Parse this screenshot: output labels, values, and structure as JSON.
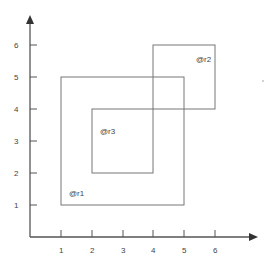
{
  "diagram": {
    "title": "",
    "x_axis": {
      "ticks": [
        {
          "value": 1,
          "label": "1"
        },
        {
          "value": 2,
          "label": "2"
        },
        {
          "value": 3,
          "label": "3"
        },
        {
          "value": 4,
          "label": "4"
        },
        {
          "value": 5,
          "label": "5"
        },
        {
          "value": 6,
          "label": "6"
        }
      ]
    },
    "y_axis": {
      "ticks": [
        {
          "value": 1,
          "label": "1"
        },
        {
          "value": 2,
          "label": "2"
        },
        {
          "value": 3,
          "label": "3"
        },
        {
          "value": 4,
          "label": "4"
        },
        {
          "value": 5,
          "label": "5"
        },
        {
          "value": 6,
          "label": "6"
        }
      ]
    },
    "rectangles": [
      {
        "id": "r1",
        "label": "@r1",
        "x1": 1,
        "y1": 1,
        "x2": 5,
        "y2": 5
      },
      {
        "id": "r2",
        "label": "@r2",
        "x1": 4,
        "y1": 4,
        "x2": 6,
        "y2": 6
      },
      {
        "id": "r3",
        "label": "@r3",
        "x1": 2,
        "y1": 2,
        "x2": 4,
        "y2": 4
      }
    ],
    "colors": {
      "axis": "#555555",
      "rect_stroke": "#777777",
      "text": "#444444"
    }
  }
}
